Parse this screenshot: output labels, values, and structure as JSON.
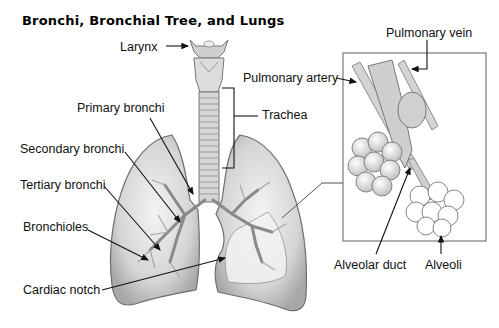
{
  "title": "Bronchi, Bronchial Tree, and Lungs",
  "labels": {
    "larynx": "Larynx",
    "primary_bronchi": "Primary bronchi",
    "secondary_bronchi": "Secondary bronchi",
    "tertiary_bronchi": "Tertiary bronchi",
    "bronchioles": "Bronchioles",
    "cardiac_notch": "Cardiac notch",
    "trachea": "Trachea",
    "pulmonary_artery": "Pulmonary artery",
    "pulmonary_vein": "Pulmonary vein",
    "alveolar_duct": "Alveolar duct",
    "alveoli": "Alveoli"
  },
  "colors": {
    "lung_fill": "#d9d9d9",
    "lung_stroke": "#6e6e6e",
    "leader_line": "#111111",
    "inset_border": "#7a7a7a"
  }
}
